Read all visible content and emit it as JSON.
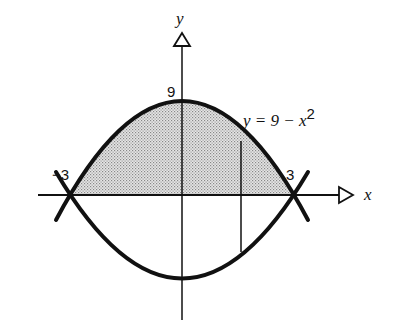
{
  "diagram": {
    "type": "region-between-curves",
    "axes": {
      "x_label": "x",
      "y_label": "y"
    },
    "tick_labels": {
      "x_neg": "−3",
      "x_pos": "3",
      "y_top": "9"
    },
    "curve_label": {
      "lhs": "y = 9 − x",
      "exponent": "2"
    },
    "curves": [
      {
        "name": "upper",
        "equation": "y = 9 - x^2",
        "vertex": [
          0,
          9
        ],
        "roots": [
          -3,
          3
        ]
      },
      {
        "name": "lower",
        "description": "reflected curve below x-axis, through (-3,0) and (3,0)"
      }
    ],
    "shaded_region": "area between y = 9 - x^2 and x-axis from x = -3 to x = 3",
    "strip": {
      "description": "vertical line segment at x ≈ 1.6 from upper curve to lower curve"
    },
    "colors": {
      "ink": "#111111",
      "shade": "#bdbdbd",
      "background": "#ffffff"
    }
  }
}
